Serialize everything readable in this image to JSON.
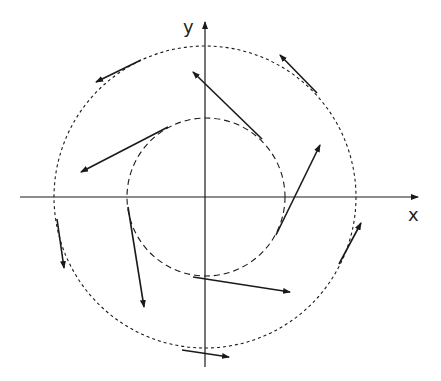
{
  "diagram": {
    "title": "",
    "axes": {
      "x_label": "x",
      "y_label": "y",
      "origin": [
        205,
        197
      ],
      "x_axis": {
        "from": [
          20,
          197
        ],
        "to": [
          418,
          197
        ]
      },
      "y_axis": {
        "from": [
          205,
          367
        ],
        "to": [
          205,
          22
        ]
      }
    },
    "circles": [
      {
        "name": "outer-circle",
        "cx": 205,
        "cy": 197,
        "r": 151,
        "style": "dotted"
      },
      {
        "name": "inner-circle",
        "cx": 206,
        "cy": 197,
        "r": 79,
        "style": "dashed"
      }
    ],
    "arrows": [
      {
        "name": "outer-arrow-top-left",
        "from": [
          141,
          60
        ],
        "to": [
          96,
          82
        ]
      },
      {
        "name": "outer-arrow-top-right",
        "from": [
          317,
          93
        ],
        "to": [
          280,
          55
        ]
      },
      {
        "name": "outer-arrow-right",
        "from": [
          339,
          264
        ],
        "to": [
          361,
          223
        ]
      },
      {
        "name": "outer-arrow-bottom",
        "from": [
          182,
          350
        ],
        "to": [
          229,
          357
        ]
      },
      {
        "name": "outer-arrow-left",
        "from": [
          57,
          219
        ],
        "to": [
          64,
          268
        ]
      },
      {
        "name": "inner-arrow-top",
        "from": [
          262,
          139
        ],
        "to": [
          193,
          72
        ]
      },
      {
        "name": "inner-arrow-right",
        "from": [
          276,
          235
        ],
        "to": [
          320,
          145
        ]
      },
      {
        "name": "inner-arrow-bottom",
        "from": [
          193,
          277
        ],
        "to": [
          290,
          292
        ]
      },
      {
        "name": "inner-arrow-left-lower",
        "from": [
          128,
          207
        ],
        "to": [
          144,
          307
        ]
      },
      {
        "name": "inner-arrow-left-upper",
        "from": [
          168,
          127
        ],
        "to": [
          81,
          172
        ]
      }
    ],
    "colors": {
      "stroke": "#1a1a1a",
      "background": "#ffffff"
    }
  }
}
